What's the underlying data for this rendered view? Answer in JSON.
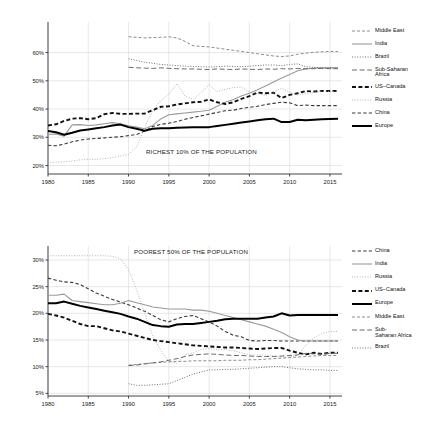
{
  "figure": {
    "panels": [
      {
        "id": "richest-10",
        "title": "RICHEST 10% OF THE POPULATION",
        "legend": [
          {
            "name": "Middle East",
            "style": "dashed-fine",
            "color": "#8c8c8c",
            "width": 1.0
          },
          {
            "name": "India",
            "style": "solid",
            "color": "#9a9a9a",
            "width": 1.1
          },
          {
            "name": "Brazil",
            "style": "dotted",
            "color": "#6f6f6f",
            "width": 1.0
          },
          {
            "name": "Sub-Saharan\nAfrica",
            "style": "dashed-long",
            "color": "#6b6b6b",
            "width": 1.0
          },
          {
            "name": "US–Canada",
            "style": "dashed-bold",
            "color": "#111111",
            "width": 1.9
          },
          {
            "name": "Russia",
            "style": "dotted-fine",
            "color": "#a5a5a5",
            "width": 0.9
          },
          {
            "name": "China",
            "style": "dash-dash",
            "color": "#3a3a3a",
            "width": 1.1
          },
          {
            "name": "Europe",
            "style": "solid-bold",
            "color": "#000000",
            "width": 2.0
          }
        ]
      },
      {
        "id": "poorest-50",
        "title": "POOREST 50% OF THE POPULATION",
        "legend": [
          {
            "name": "China",
            "style": "dash-dash",
            "color": "#3a3a3a",
            "width": 1.1
          },
          {
            "name": "India",
            "style": "solid",
            "color": "#9a9a9a",
            "width": 1.1
          },
          {
            "name": "Russia",
            "style": "dotted-fine",
            "color": "#a5a5a5",
            "width": 0.9
          },
          {
            "name": "US–Canada",
            "style": "dashed-bold",
            "color": "#111111",
            "width": 1.9
          },
          {
            "name": "Europe",
            "style": "solid-bold",
            "color": "#000000",
            "width": 2.0
          },
          {
            "name": "Middle East",
            "style": "dashed-fine",
            "color": "#8c8c8c",
            "width": 1.0
          },
          {
            "name": "Sub-\nSaharan Africa",
            "style": "dashed-long",
            "color": "#6b6b6b",
            "width": 1.0
          },
          {
            "name": "Brazil",
            "style": "dotted",
            "color": "#6f6f6f",
            "width": 1.0
          }
        ]
      }
    ]
  },
  "chart_data": [
    {
      "type": "line",
      "title": "RICHEST 10% OF THE POPULATION",
      "xlabel": "",
      "ylabel": "",
      "xlim": [
        1980,
        2016
      ],
      "ylim": [
        17,
        68
      ],
      "xticks": [
        1980,
        1985,
        1990,
        1995,
        2000,
        2005,
        2010,
        2015
      ],
      "yticks": [
        20,
        30,
        40,
        50,
        60
      ],
      "ytick_labels": [
        "20%",
        "30%",
        "40%",
        "50%",
        "60%"
      ],
      "grid": true,
      "legend_position": "right",
      "x": [
        1980,
        1981,
        1982,
        1983,
        1984,
        1985,
        1986,
        1987,
        1988,
        1989,
        1990,
        1991,
        1992,
        1993,
        1994,
        1995,
        1996,
        1997,
        1998,
        1999,
        2000,
        2001,
        2002,
        2003,
        2004,
        2005,
        2006,
        2007,
        2008,
        2009,
        2010,
        2011,
        2012,
        2013,
        2014,
        2015,
        2016
      ],
      "series": [
        {
          "name": "Middle East",
          "values": [
            null,
            null,
            null,
            null,
            null,
            null,
            null,
            null,
            null,
            null,
            65.6,
            65.4,
            65.2,
            65.3,
            65.4,
            65.6,
            65.2,
            64.0,
            62.4,
            62.2,
            62.0,
            61.6,
            61.2,
            60.8,
            60.4,
            60.0,
            59.6,
            59.2,
            58.8,
            58.6,
            58.8,
            59.4,
            59.8,
            60.1,
            60.3,
            60.4,
            60.4
          ]
        },
        {
          "name": "India",
          "values": [
            31.0,
            31.2,
            30.4,
            34.4,
            34.5,
            34.2,
            34.4,
            34.8,
            35.2,
            34.8,
            34.1,
            33.6,
            33.0,
            34.2,
            36.5,
            38.0,
            38.3,
            38.6,
            38.9,
            39.2,
            39.6,
            41.0,
            42.4,
            43.4,
            44.6,
            45.6,
            46.8,
            48.2,
            49.6,
            51.0,
            52.2,
            53.6,
            54.2,
            54.5,
            54.6,
            54.6,
            54.6
          ]
        },
        {
          "name": "Brazil",
          "values": [
            null,
            null,
            null,
            null,
            null,
            null,
            null,
            null,
            null,
            null,
            57.8,
            57.2,
            56.6,
            56.2,
            55.8,
            55.6,
            55.4,
            55.2,
            55.1,
            55.0,
            54.9,
            55.0,
            55.2,
            55.1,
            55.0,
            55.2,
            55.4,
            55.6,
            55.6,
            55.4,
            55.8,
            56.0,
            55.0,
            54.8,
            54.6,
            54.6,
            54.6
          ]
        },
        {
          "name": "Sub-Saharan Africa",
          "values": [
            null,
            null,
            null,
            null,
            null,
            null,
            null,
            null,
            null,
            null,
            54.8,
            54.6,
            54.5,
            54.4,
            54.6,
            54.4,
            54.3,
            54.2,
            54.2,
            54.1,
            54.0,
            54.2,
            54.1,
            54.0,
            54.2,
            54.1,
            54.0,
            54.2,
            54.1,
            54.3,
            54.2,
            54.4,
            54.3,
            54.3,
            54.4,
            54.3,
            54.3
          ]
        },
        {
          "name": "US–Canada",
          "values": [
            34.2,
            34.6,
            35.8,
            36.6,
            36.8,
            36.4,
            36.8,
            38.2,
            38.6,
            38.3,
            38.3,
            38.4,
            38.4,
            39.6,
            40.8,
            41.0,
            41.6,
            42.0,
            42.4,
            42.6,
            43.4,
            42.4,
            41.8,
            42.4,
            43.6,
            44.6,
            45.8,
            45.6,
            45.8,
            43.9,
            45.0,
            45.6,
            46.4,
            46.2,
            46.4,
            46.4,
            46.4
          ]
        },
        {
          "name": "Russia",
          "values": [
            21.0,
            21.2,
            21.3,
            21.6,
            22.0,
            22.2,
            22.2,
            22.4,
            22.8,
            23.4,
            24.0,
            26.6,
            33.6,
            39.4,
            43.0,
            45.2,
            49.0,
            44.6,
            43.4,
            45.8,
            48.6,
            46.2,
            47.0,
            47.6,
            47.8,
            46.0,
            45.6,
            44.8,
            46.0,
            47.4,
            46.0,
            45.0,
            45.4,
            46.0,
            46.2,
            46.2,
            46.2
          ]
        },
        {
          "name": "China",
          "values": [
            27.2,
            27.0,
            27.6,
            28.4,
            29.0,
            29.4,
            29.6,
            29.8,
            30.0,
            30.2,
            30.6,
            31.0,
            32.2,
            33.8,
            34.6,
            35.0,
            35.6,
            36.4,
            37.0,
            37.6,
            38.2,
            38.8,
            39.4,
            39.6,
            40.2,
            40.6,
            41.0,
            41.6,
            42.0,
            42.4,
            42.2,
            41.2,
            41.4,
            41.2,
            41.2,
            41.2,
            41.2
          ]
        },
        {
          "name": "Europe",
          "values": [
            32.2,
            31.8,
            30.9,
            31.6,
            32.4,
            32.8,
            33.2,
            33.6,
            34.2,
            34.5,
            33.6,
            33.0,
            32.3,
            33.0,
            33.2,
            33.2,
            33.4,
            33.5,
            33.6,
            33.6,
            33.6,
            34.0,
            34.4,
            34.8,
            35.2,
            35.6,
            36.0,
            36.4,
            36.6,
            35.4,
            35.4,
            36.2,
            36.0,
            36.2,
            36.4,
            36.5,
            36.6
          ]
        }
      ]
    },
    {
      "type": "line",
      "title": "POOREST 50% OF THE POPULATION",
      "xlabel": "",
      "ylabel": "",
      "xlim": [
        1980,
        2016
      ],
      "ylim": [
        4.5,
        31.5
      ],
      "xticks": [
        1980,
        1985,
        1990,
        1995,
        2000,
        2005,
        2010,
        2015
      ],
      "yticks": [
        5,
        10,
        15,
        20,
        25,
        30
      ],
      "ytick_labels": [
        "5%",
        "10%",
        "15%",
        "20%",
        "25%",
        "30%"
      ],
      "grid": true,
      "legend_position": "right",
      "x": [
        1980,
        1981,
        1982,
        1983,
        1984,
        1985,
        1986,
        1987,
        1988,
        1989,
        1990,
        1991,
        1992,
        1993,
        1994,
        1995,
        1996,
        1997,
        1998,
        1999,
        2000,
        2001,
        2002,
        2003,
        2004,
        2005,
        2006,
        2007,
        2008,
        2009,
        2010,
        2011,
        2012,
        2013,
        2014,
        2015,
        2016
      ],
      "series": [
        {
          "name": "China",
          "values": [
            26.6,
            26.2,
            25.9,
            25.8,
            25.4,
            24.6,
            23.8,
            23.2,
            22.6,
            22.1,
            21.6,
            21.0,
            20.4,
            19.6,
            18.8,
            18.4,
            19.0,
            19.4,
            19.6,
            19.0,
            18.4,
            17.6,
            16.6,
            15.9,
            15.6,
            14.9,
            14.8,
            14.9,
            14.9,
            14.8,
            14.8,
            14.8,
            14.8,
            14.8,
            14.8,
            14.8,
            14.8
          ]
        },
        {
          "name": "India",
          "values": [
            23.4,
            23.4,
            23.6,
            22.4,
            22.2,
            22.0,
            21.8,
            21.6,
            21.6,
            21.9,
            22.4,
            22.0,
            21.6,
            21.2,
            21.0,
            20.8,
            20.8,
            20.8,
            20.6,
            20.6,
            20.4,
            20.0,
            19.6,
            19.2,
            18.8,
            18.4,
            18.0,
            17.6,
            17.0,
            16.4,
            15.6,
            15.0,
            14.8,
            14.8,
            14.8,
            14.8,
            14.8
          ]
        },
        {
          "name": "Russia",
          "values": [
            30.8,
            30.8,
            30.8,
            30.8,
            30.8,
            30.8,
            30.8,
            30.8,
            30.7,
            30.2,
            28.2,
            24.4,
            20.0,
            15.8,
            13.0,
            11.0,
            10.6,
            12.2,
            12.6,
            13.2,
            13.4,
            13.2,
            13.2,
            13.0,
            12.6,
            12.2,
            12.2,
            12.2,
            12.0,
            11.8,
            11.8,
            12.2,
            14.0,
            15.4,
            16.2,
            16.6,
            16.6
          ]
        },
        {
          "name": "US–Canada",
          "values": [
            19.9,
            19.6,
            19.2,
            18.6,
            18.0,
            17.6,
            17.6,
            17.2,
            16.8,
            16.6,
            16.2,
            15.8,
            15.4,
            15.0,
            14.8,
            14.6,
            14.4,
            14.2,
            14.0,
            13.9,
            13.8,
            13.7,
            13.6,
            13.6,
            13.5,
            13.4,
            13.3,
            13.4,
            13.5,
            13.5,
            13.0,
            12.6,
            12.3,
            12.6,
            12.4,
            12.6,
            12.6
          ]
        },
        {
          "name": "Europe",
          "values": [
            21.9,
            21.9,
            22.2,
            21.8,
            21.4,
            21.1,
            20.8,
            20.5,
            20.2,
            19.9,
            19.4,
            19.0,
            18.4,
            17.8,
            17.6,
            17.5,
            17.9,
            18.0,
            18.0,
            18.2,
            18.4,
            18.6,
            18.9,
            19.0,
            19.0,
            19.0,
            19.0,
            19.2,
            19.4,
            20.0,
            19.6,
            19.7,
            19.7,
            19.7,
            19.7,
            19.7,
            19.7
          ]
        },
        {
          "name": "Middle East",
          "values": [
            null,
            null,
            null,
            null,
            null,
            null,
            null,
            null,
            null,
            null,
            10.3,
            10.4,
            10.6,
            10.7,
            10.8,
            10.9,
            11.0,
            11.0,
            11.1,
            11.1,
            11.1,
            11.1,
            11.2,
            11.2,
            11.2,
            11.3,
            11.3,
            11.4,
            11.5,
            11.6,
            11.7,
            11.8,
            11.9,
            12.0,
            12.1,
            12.1,
            12.1
          ]
        },
        {
          "name": "Sub-Saharan Africa",
          "values": [
            null,
            null,
            null,
            null,
            null,
            null,
            null,
            null,
            null,
            null,
            10.2,
            10.3,
            10.5,
            10.7,
            10.9,
            11.2,
            11.5,
            11.9,
            12.2,
            12.3,
            12.4,
            12.3,
            12.2,
            12.1,
            12.1,
            12.0,
            11.9,
            11.9,
            11.9,
            12.0,
            12.1,
            12.2,
            12.5,
            12.4,
            12.3,
            12.5,
            12.5
          ]
        },
        {
          "name": "Brazil",
          "values": [
            null,
            null,
            null,
            null,
            null,
            null,
            null,
            null,
            null,
            null,
            6.8,
            6.5,
            6.5,
            6.6,
            6.7,
            6.8,
            7.4,
            8.0,
            8.6,
            9.0,
            9.4,
            9.4,
            9.5,
            9.5,
            9.6,
            9.7,
            9.8,
            9.9,
            10.0,
            10.0,
            9.8,
            9.6,
            9.5,
            9.4,
            9.4,
            9.3,
            9.3
          ]
        }
      ]
    }
  ]
}
